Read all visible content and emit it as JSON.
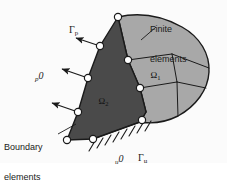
{
  "figure": {
    "colors": {
      "be_region_fill": "#4a4a4a",
      "fe_region_fill": "#a8a8a8",
      "outline": "#1a1a1a",
      "node_fill": "#ffffff",
      "background": "#fbfbfb",
      "text": "#1a1a1a"
    },
    "callouts": [
      {
        "id": "finite-elements",
        "line1": "Finite",
        "line2": "elements"
      },
      {
        "id": "boundary-elements",
        "line1": "Boundary",
        "line2": "elements"
      }
    ],
    "labels": {
      "gamma_p": {
        "symbol": "Γ",
        "sub": "p"
      },
      "gamma_u": {
        "symbol": "Γ",
        "sub": "u"
      },
      "traction": {
        "pre": "p",
        "symbol": "0"
      },
      "displacement": {
        "pre": "u",
        "symbol": "0"
      },
      "omega_1": {
        "symbol": "Ω",
        "sub": "1"
      },
      "omega_2": {
        "symbol": "Ω",
        "sub": "2"
      }
    },
    "regions": [
      {
        "id": "omega-2",
        "kind": "boundary-element-region",
        "shade": "dark"
      },
      {
        "id": "omega-1",
        "kind": "finite-element-region",
        "shade": "light"
      }
    ],
    "counts": {
      "traction_arrows": 3,
      "interface_nodes": 3,
      "boundary_nodes": 8
    }
  }
}
